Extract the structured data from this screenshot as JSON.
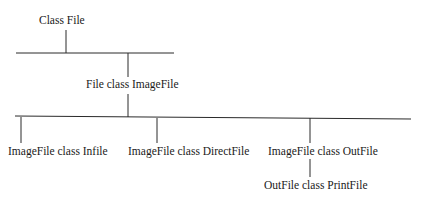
{
  "diagram": {
    "type": "class-hierarchy-tree",
    "nodes": {
      "root": "Class File",
      "level1": "File class ImageFile",
      "level2": [
        "ImageFile class Infile",
        "ImageFile class DirectFile",
        "ImageFile class OutFile"
      ],
      "level3": "OutFile class PrintFile"
    },
    "edges": [
      [
        "Class File",
        "File class ImageFile"
      ],
      [
        "File class ImageFile",
        "ImageFile class Infile"
      ],
      [
        "File class ImageFile",
        "ImageFile class DirectFile"
      ],
      [
        "File class ImageFile",
        "ImageFile class OutFile"
      ],
      [
        "ImageFile class OutFile",
        "OutFile class PrintFile"
      ]
    ],
    "line_color": "#2a2a2a"
  }
}
